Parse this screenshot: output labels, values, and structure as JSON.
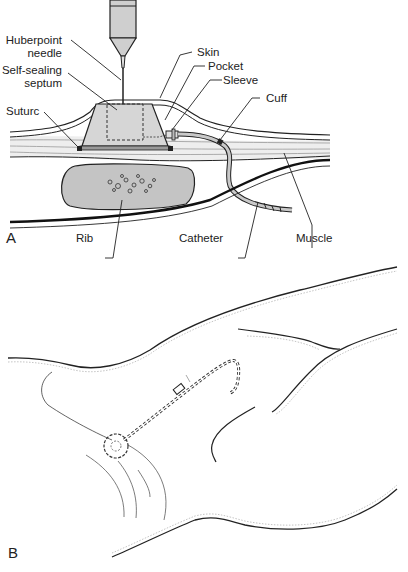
{
  "figure": {
    "panel_a": {
      "letter": "A",
      "labels": {
        "huberpoint_line1": "Huberpoint",
        "huberpoint_line2": "needle",
        "septum_line1": "Self-sealing",
        "septum_line2": "septum",
        "suture": "Suturc",
        "skin": "Skin",
        "pocket": "Pocket",
        "sleeve": "Sleeve",
        "cuff": "Cuff",
        "rib": "Rib",
        "catheter": "Catheter",
        "muscle": "Muscle"
      }
    },
    "panel_b": {
      "letter": "B"
    },
    "colors": {
      "line": "#222222",
      "fill_gray": "#c9c9c9",
      "tissue_gray": "#e6e6e6",
      "rib_fill": "#c4c4c4"
    }
  }
}
